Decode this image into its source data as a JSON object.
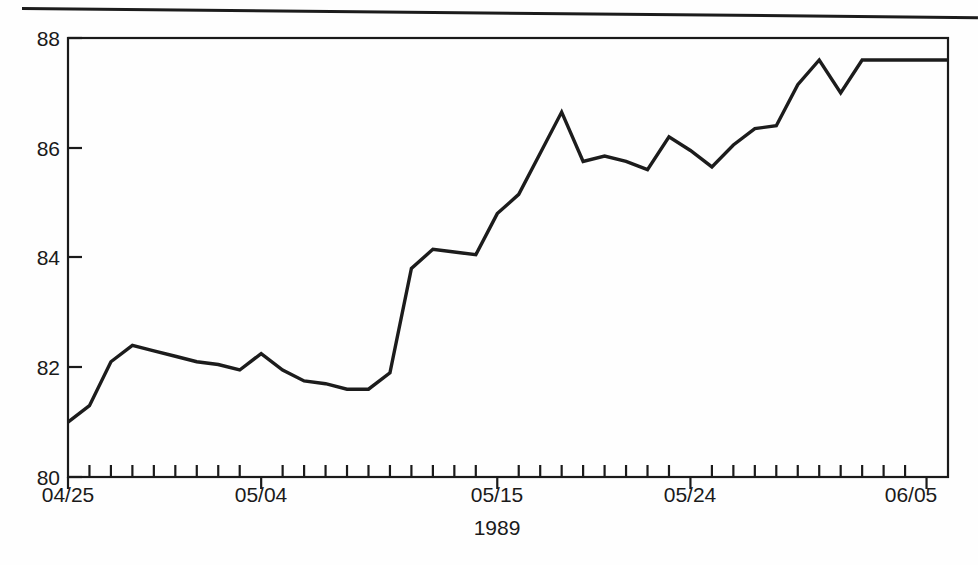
{
  "figure": {
    "top_rule": "horizontal-rule",
    "background_color": "#fefefe",
    "line_color": "#1c1c1c",
    "axis_color": "#1a1a1a"
  },
  "chart_data": {
    "type": "line",
    "title": "",
    "subtitle": "",
    "xlabel": "1989",
    "ylabel": "",
    "ylim": [
      80,
      88
    ],
    "ytick_labels": [
      "80",
      "82",
      "84",
      "86",
      "88"
    ],
    "yticks": [
      80,
      82,
      84,
      86,
      88
    ],
    "grid": false,
    "legend": "none",
    "x_major_tick_labels": [
      "04/25",
      "05/04",
      "05/15",
      "05/24",
      "06/05"
    ],
    "x_major_tick_indices": [
      0,
      9,
      20,
      29,
      40
    ],
    "n_ticks": 42,
    "x": [
      "04/25",
      "04/26",
      "04/27",
      "04/28",
      "04/29",
      "04/30",
      "05/01",
      "05/02",
      "05/03",
      "05/04",
      "05/05",
      "05/06",
      "05/07",
      "05/08",
      "05/09",
      "05/10",
      "05/11",
      "05/12",
      "05/13",
      "05/14",
      "05/15",
      "05/16",
      "05/17",
      "05/18",
      "05/19",
      "05/20",
      "05/21",
      "05/22",
      "05/23",
      "05/24",
      "05/25",
      "05/26",
      "05/27",
      "05/28",
      "05/29",
      "05/30",
      "05/31",
      "06/01",
      "06/02",
      "06/03",
      "06/05",
      "06/06"
    ],
    "values": [
      81.0,
      81.3,
      82.1,
      82.4,
      82.3,
      82.2,
      82.1,
      82.05,
      81.95,
      82.25,
      81.95,
      81.75,
      81.7,
      81.6,
      81.6,
      81.9,
      83.8,
      84.15,
      84.1,
      84.05,
      84.8,
      85.15,
      85.9,
      86.65,
      85.75,
      85.85,
      85.75,
      85.6,
      86.2,
      85.95,
      85.65,
      86.05,
      86.35,
      86.4,
      87.15,
      87.6,
      87.0,
      87.6,
      87.6,
      87.6,
      87.6,
      87.6
    ]
  }
}
